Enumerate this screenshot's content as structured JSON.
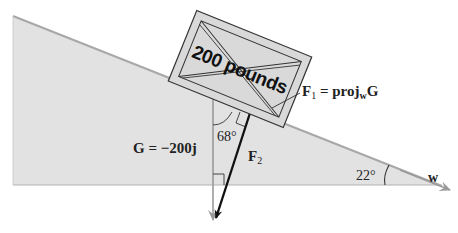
{
  "diagram": {
    "box_label": "200 pounds",
    "labels": {
      "f1_main": "F",
      "f1_sub": "1",
      "f1_eq": " = proj",
      "f1_proj_sub": "w",
      "f1_proj_vec": "G",
      "f2_main": "F",
      "f2_sub": "2",
      "g_eq": "G = −200j",
      "angle_68": "68°",
      "angle_22": "22°",
      "w": "w"
    },
    "colors": {
      "incline_fill": "#e2e2e2",
      "incline_edge": "#a8a8a8",
      "box_fill": "#d6d6d6",
      "box_edge": "#333333",
      "force_arrow": "#111111",
      "gravity_arrow": "#9a9a9a"
    }
  }
}
